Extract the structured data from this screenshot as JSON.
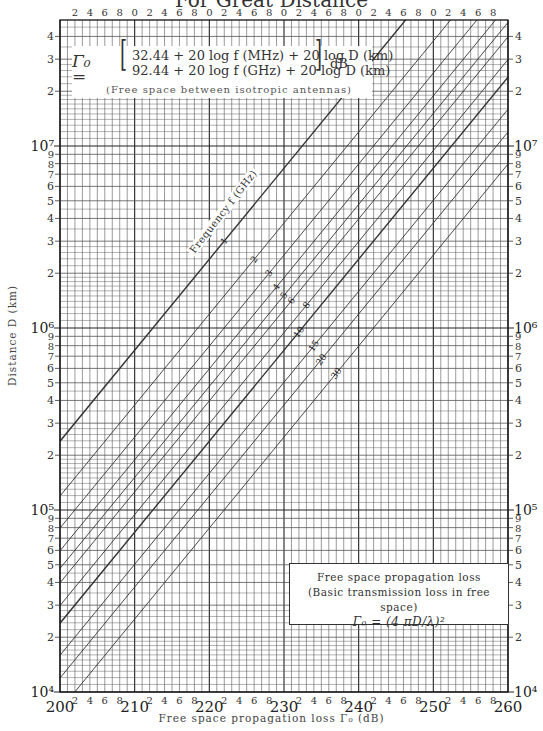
{
  "page": {
    "title_partial": "For Great Distance",
    "y_axis_label": "Distance D (km)",
    "x_axis_label": "Free space propagation loss Γ₀ (dB)",
    "frequency_axis_label": "Frequency f (GHz)"
  },
  "formula": {
    "symbol": "Γ₀ =",
    "row1": "32.44 + 20 log f (MHz) + 20 log D (km)",
    "row2": "92.44 + 20 log f (GHz) + 20 log D (km)",
    "unit": "dB",
    "note": "(Free space between isotropic antennas)"
  },
  "legend": {
    "line1": "Free space propagation loss",
    "line2": "(Basic transmission loss in free space)",
    "line3": "Γ₀ = (4 πD/λ)²"
  },
  "chart_data": {
    "type": "line",
    "title": "For Great Distance",
    "xlabel": "Free space propagation loss Γ0 (dB)",
    "ylabel": "Distance D (km)",
    "xlim": [
      200,
      260
    ],
    "ylim": [
      10000,
      49000000
    ],
    "yscale": "log",
    "grid": true,
    "x_major_ticks": [
      200,
      210,
      220,
      230,
      240,
      250,
      260
    ],
    "x_minor_tick_labels": [
      "2",
      "4",
      "6",
      "8"
    ],
    "top_axis_tick_labels": [
      "2",
      "4",
      "6",
      "8",
      "0",
      "2",
      "4",
      "6",
      "8",
      "0",
      "2",
      "4",
      "6",
      "8",
      "0",
      "2",
      "4",
      "6",
      "8",
      "0",
      "2",
      "4",
      "6",
      "8",
      "0",
      "2",
      "4",
      "6",
      "8"
    ],
    "y_decade_labels": [
      "10^4",
      "10^5",
      "10^6",
      "10^7"
    ],
    "y_minor_tick_labels": [
      "2",
      "3",
      "4",
      "5",
      "6",
      "7",
      "8",
      "9"
    ],
    "formula": "Γ0 = 92.44 + 20 log f(GHz) + 20 log D(km)",
    "series_parameter": "Frequency f (GHz)",
    "series": [
      {
        "name": "1 GHz",
        "f_ghz": 1,
        "label": "1",
        "D_at_200dB": 239000
      },
      {
        "name": "2 GHz",
        "f_ghz": 2,
        "label": "2",
        "D_at_200dB": 119500
      },
      {
        "name": "3 GHz",
        "f_ghz": 3,
        "label": "3",
        "D_at_200dB": 79700
      },
      {
        "name": "4 GHz",
        "f_ghz": 4,
        "label": "4",
        "D_at_200dB": 59800
      },
      {
        "name": "5 GHz",
        "f_ghz": 5,
        "label": "5",
        "D_at_200dB": 47800
      },
      {
        "name": "6 GHz",
        "f_ghz": 6,
        "label": "6",
        "D_at_200dB": 39800
      },
      {
        "name": "8 GHz",
        "f_ghz": 8,
        "label": "8",
        "D_at_200dB": 29900
      },
      {
        "name": "10 GHz",
        "f_ghz": 10,
        "label": "10",
        "D_at_200dB": 23900
      },
      {
        "name": "15 GHz",
        "f_ghz": 15,
        "label": "15",
        "D_at_200dB": 15900
      },
      {
        "name": "20 GHz",
        "f_ghz": 20,
        "label": "20",
        "D_at_200dB": 12000
      },
      {
        "name": "30 GHz",
        "f_ghz": 30,
        "label": "30",
        "D_at_200dB": 7970
      }
    ],
    "label_positions_loss_db": [
      222,
      226,
      228,
      229,
      230,
      231,
      233,
      232,
      234,
      235,
      237
    ]
  },
  "colors": {
    "grid": "#555555",
    "major_line": "#222222",
    "series_line": "#333333",
    "background": "#ffffff"
  }
}
